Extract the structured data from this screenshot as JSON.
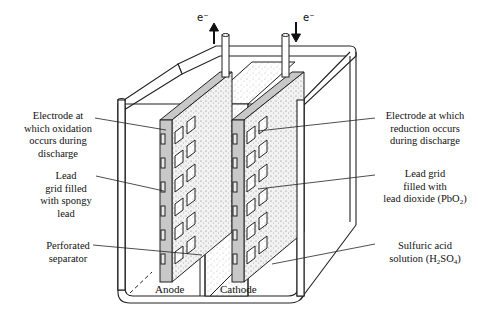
{
  "diagram": {
    "electron_flow": {
      "anode_terminal": {
        "label": "e⁻",
        "direction": "up"
      },
      "cathode_terminal": {
        "label": "e⁻",
        "direction": "down"
      }
    },
    "plates": {
      "anode": "Anode",
      "cathode": "Cathode"
    },
    "left_labels": [
      {
        "id": "anode-electrode",
        "lines": [
          "Electrode at",
          "which oxidation",
          "occurs during",
          "discharge"
        ]
      },
      {
        "id": "anode-grid",
        "lines": [
          "Lead",
          "grid filled",
          "with spongy",
          "lead"
        ]
      },
      {
        "id": "separator",
        "lines": [
          "Perforated",
          "separator"
        ]
      }
    ],
    "right_labels": [
      {
        "id": "cathode-electrode",
        "lines": [
          "Electrode at which",
          "reduction occurs",
          "during discharge"
        ]
      },
      {
        "id": "cathode-grid",
        "lines": [
          "Lead grid",
          "filled with"
        ],
        "formula_line": {
          "prefix": "lead dioxide (PbO",
          "sub": "2",
          "suffix": ")"
        }
      },
      {
        "id": "electrolyte",
        "lines": [
          "Sulfuric acid"
        ],
        "formula_line": {
          "prefix": "solution (H",
          "sub": "2",
          "mid": "SO",
          "sub2": "4",
          "suffix": ")"
        }
      }
    ],
    "colors": {
      "line": "#222222",
      "grid_fill": "#c8c8c8",
      "paste_fill": "#e8e8e8",
      "background": "#ffffff"
    }
  }
}
